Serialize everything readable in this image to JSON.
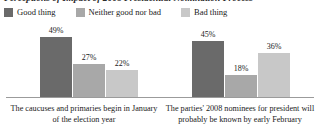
{
  "chart_data": {
    "type": "bar",
    "title": "Perceptions of Impact of 2008 Presidential Nomination Process",
    "xlabel": "",
    "ylabel": "",
    "ylim": [
      0,
      60
    ],
    "grid": false,
    "legend_position": "top-left",
    "categories": [
      "The caucuses and primaries begin in January of the election year",
      "The parties' 2008 nominees for president will probably be known by early February"
    ],
    "series": [
      {
        "name": "Good thing",
        "color": "#6a6a6a",
        "values": [
          49,
          45
        ],
        "labels": [
          "49%",
          "45%"
        ]
      },
      {
        "name": "Neither good nor bad",
        "color": "#a8a8a8",
        "values": [
          27,
          18
        ],
        "labels": [
          "27%",
          "18%"
        ]
      },
      {
        "name": "Bad thing",
        "color": "#c8c8c8",
        "values": [
          22,
          36
        ],
        "labels": [
          "22%",
          "36%"
        ]
      }
    ]
  },
  "legend": {
    "items": [
      {
        "label": "Good thing",
        "color": "#6a6a6a"
      },
      {
        "label": "Neither good nor bad",
        "color": "#a8a8a8"
      },
      {
        "label": "Bad thing",
        "color": "#c8c8c8"
      }
    ]
  },
  "colors": {
    "good": "#6a6a6a",
    "neutral": "#a8a8a8",
    "bad": "#c8c8c8",
    "axis": "#9b9b9b",
    "text": "#1a1a1a",
    "background": "#ffffff"
  }
}
